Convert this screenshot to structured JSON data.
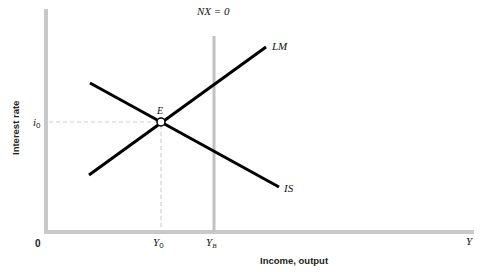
{
  "diagram": {
    "type": "IS-LM-NX diagram",
    "axes": {
      "y_label": "Interest rate",
      "x_label": "Income, output",
      "origin_label": "0",
      "x_end_label": "Y"
    },
    "curves": {
      "is_label": "IS",
      "lm_label": "LM",
      "nx_label": "NX = 0"
    },
    "equilibrium": {
      "point_label": "E",
      "rate_label": "i",
      "rate_sub": "0",
      "income_label": "Y",
      "income_sub": "0"
    },
    "nx_income": {
      "label": "Y",
      "sub": "B"
    },
    "colors": {
      "axis": "#c8c8c8",
      "nx_line": "#c0c0c0",
      "curves": "#000000",
      "dashed": "#d0d0d0",
      "text": "#111111"
    }
  }
}
